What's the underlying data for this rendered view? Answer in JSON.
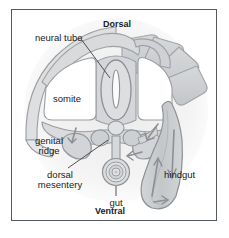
{
  "figure": {
    "title_orientation_top": "Dorsal",
    "title_orientation_bottom": "Ventral",
    "labels": {
      "neural_tube": "neural tube",
      "somite": "somite",
      "genital_ridge_line1": "genital",
      "genital_ridge_line2": "ridge",
      "dorsal_mesentery_line1": "dorsal",
      "dorsal_mesentery_line2": "mesentery",
      "gut": "gut",
      "hindgut": "hindgut"
    },
    "colors": {
      "frame_border": "#555a5e",
      "background": "#ffffff",
      "tissue_light": "#e3e4e5",
      "tissue_mid": "#cdcfd1",
      "tissue_dark": "#b9bbbe",
      "outline": "#8e9194",
      "leader_line": "#4a4a4a",
      "text": "#1b1b1b",
      "shadow_halo": "#f1f1f1"
    }
  }
}
